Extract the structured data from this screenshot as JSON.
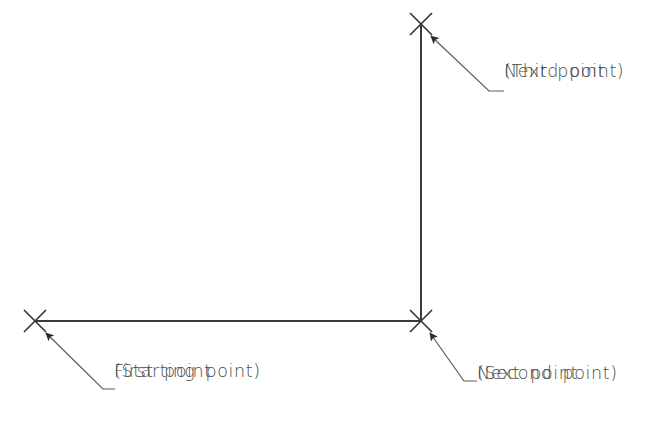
{
  "diagram": {
    "background_color": "#ffffff",
    "line_color": "#3a3a3a",
    "text_color": "#4a4a4a",
    "geometry": {
      "polyline_label": "two-segment polyline",
      "vertices": [
        {
          "name": "first-point",
          "x": 35,
          "y": 321
        },
        {
          "name": "second-point",
          "x": 421,
          "y": 321
        },
        {
          "name": "third-point",
          "x": 421,
          "y": 24
        }
      ],
      "marker_shape": "x-cross",
      "marker_arm_half_length": 11
    },
    "annotations": [
      {
        "id": "first-point",
        "line1": "First point",
        "line2": "(Starting point)",
        "text_x": 114,
        "text_y": 360,
        "arrow_tip_x": 46,
        "arrow_tip_y": 333,
        "elbow_x": 103,
        "elbow_y": 389,
        "leader_end_x": 115,
        "leader_end_y": 389
      },
      {
        "id": "second-point",
        "line1": "Next point",
        "line2": "(Second point)",
        "text_x": 477,
        "text_y": 362,
        "arrow_tip_x": 430,
        "arrow_tip_y": 333,
        "elbow_x": 464,
        "elbow_y": 381,
        "leader_end_x": 477,
        "leader_end_y": 381
      },
      {
        "id": "third-point",
        "line1": "Next point",
        "line2": "(Third point)",
        "text_x": 504,
        "text_y": 60,
        "arrow_tip_x": 431,
        "arrow_tip_y": 36,
        "elbow_x": 489,
        "elbow_y": 91,
        "leader_end_x": 504,
        "leader_end_y": 91
      }
    ]
  }
}
